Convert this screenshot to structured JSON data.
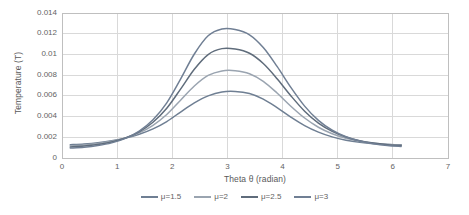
{
  "chart_data": {
    "type": "line",
    "title": "",
    "xlabel": "Theta θ (radian)",
    "ylabel": "Temperature (T)",
    "xlim": [
      0,
      7
    ],
    "ylim": [
      0,
      0.014
    ],
    "x_ticks": [
      "0",
      "1",
      "2",
      "3",
      "4",
      "5",
      "6",
      "7"
    ],
    "y_ticks": [
      "0",
      "0.002",
      "0.004",
      "0.006",
      "0.008",
      "0.01",
      "0.012",
      "0.014"
    ],
    "grid": "horizontal",
    "legend_position": "bottom",
    "x": [
      0.15,
      0.4,
      0.65,
      0.9,
      1.15,
      1.4,
      1.65,
      1.9,
      2.15,
      2.4,
      2.65,
      2.9,
      3.14,
      3.4,
      3.65,
      3.9,
      4.15,
      4.4,
      4.65,
      4.9,
      5.15,
      5.4,
      5.65,
      5.9,
      6.15
    ],
    "series": [
      {
        "name": "μ=1.5",
        "color": "#6f7f93",
        "peak_x": 3.14,
        "peak_y": 0.0064,
        "values": [
          0.00128,
          0.00136,
          0.00148,
          0.00166,
          0.00192,
          0.00229,
          0.00281,
          0.00352,
          0.00444,
          0.00532,
          0.006,
          0.00638,
          0.00643,
          0.00622,
          0.00568,
          0.00486,
          0.00395,
          0.00313,
          0.0025,
          0.00204,
          0.00172,
          0.00151,
          0.00138,
          0.00131,
          0.00128
        ]
      },
      {
        "name": "μ=2",
        "color": "#9aa4b0",
        "peak_x": 3.14,
        "peak_y": 0.0084,
        "values": [
          0.00118,
          0.00126,
          0.0014,
          0.00161,
          0.00194,
          0.00243,
          0.00316,
          0.0042,
          0.00558,
          0.00695,
          0.00797,
          0.00841,
          0.00843,
          0.00814,
          0.0074,
          0.00627,
          0.005,
          0.00386,
          0.00297,
          0.00234,
          0.00191,
          0.00162,
          0.00143,
          0.00132,
          0.00125
        ]
      },
      {
        "name": "μ=2.5",
        "color": "#5f6c7b",
        "peak_x": 3.14,
        "peak_y": 0.0105,
        "values": [
          0.00107,
          0.00115,
          0.0013,
          0.00154,
          0.00193,
          0.00253,
          0.00345,
          0.0048,
          0.00665,
          0.00857,
          0.00999,
          0.01056,
          0.01052,
          0.01011,
          0.00912,
          0.00766,
          0.00601,
          0.00452,
          0.00337,
          0.00257,
          0.00203,
          0.00167,
          0.00144,
          0.00129,
          0.0012
        ]
      },
      {
        "name": "μ=3",
        "color": "#707f94",
        "peak_x": 3.14,
        "peak_y": 0.0124,
        "values": [
          0.00096,
          0.00104,
          0.0012,
          0.00146,
          0.0019,
          0.0026,
          0.00369,
          0.00533,
          0.00762,
          0.01004,
          0.0118,
          0.01245,
          0.0124,
          0.01189,
          0.01066,
          0.00884,
          0.00682,
          0.00501,
          0.00363,
          0.00268,
          0.00205,
          0.00164,
          0.00138,
          0.00121,
          0.00111
        ]
      }
    ]
  },
  "axes": {
    "y_title": "Temperature (T)",
    "x_title": "Theta θ (radian)"
  },
  "legend": {
    "items": [
      {
        "label": "μ=1.5",
        "color": "#6f7f93"
      },
      {
        "label": "μ=2",
        "color": "#9aa4b0"
      },
      {
        "label": "μ=2.5",
        "color": "#5f6c7b"
      },
      {
        "label": "μ=3",
        "color": "#707f94"
      }
    ]
  },
  "style": {
    "grid_color": "#d9d9d9",
    "axis_color": "#bfbfbf",
    "text_color": "#636363",
    "plot_background": "#ffffff"
  }
}
